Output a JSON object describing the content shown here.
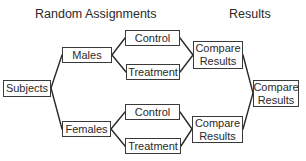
{
  "diagram": {
    "headings": {
      "random_assignments": "Random Assignments",
      "results": "Results"
    },
    "nodes": {
      "subjects": "Subjects",
      "males": "Males",
      "females": "Females",
      "males_control": "Control",
      "males_treatment": "Treatment",
      "females_control": "Control",
      "females_treatment": "Treatment",
      "males_compare_line1": "Compare",
      "males_compare_line2": "Results",
      "females_compare_line1": "Compare",
      "females_compare_line2": "Results",
      "final_compare_line1": "Compare",
      "final_compare_line2": "Results"
    },
    "edges": [
      [
        "subjects",
        "males"
      ],
      [
        "subjects",
        "females"
      ],
      [
        "males",
        "males_control"
      ],
      [
        "males",
        "males_treatment"
      ],
      [
        "females",
        "females_control"
      ],
      [
        "females",
        "females_treatment"
      ],
      [
        "males_control",
        "males_compare"
      ],
      [
        "males_treatment",
        "males_compare"
      ],
      [
        "females_control",
        "females_compare"
      ],
      [
        "females_treatment",
        "females_compare"
      ],
      [
        "males_compare",
        "final_compare"
      ],
      [
        "females_compare",
        "final_compare"
      ]
    ],
    "colors": {
      "line": "#2a2a2a",
      "box_border": "#3a3a3a",
      "text": "#2a2a2a",
      "background": "#ffffff"
    }
  }
}
